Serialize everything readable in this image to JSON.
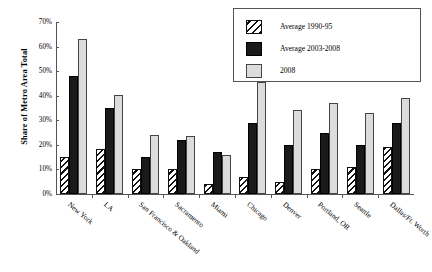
{
  "chart_data": {
    "type": "bar",
    "title": "",
    "xlabel": "",
    "ylabel": "Share of Metro Area Total",
    "ylim": [
      0,
      70
    ],
    "ytick_labels": [
      "70%",
      "60%",
      "50%",
      "40%",
      "30%",
      "20%",
      "10%",
      "0%"
    ],
    "ytick_values": [
      70,
      60,
      50,
      40,
      30,
      20,
      10,
      0
    ],
    "grid": false,
    "legend_position": "top-right",
    "categories": [
      "New York",
      "LA",
      "San Francisco & Oakland",
      "Sacramento",
      "Miami",
      "Chicago",
      "Denver",
      "Portland, OR",
      "Seattle",
      "Dallas/Ft. Worth"
    ],
    "series": [
      {
        "name": "Average 1990-95",
        "style": "hatch",
        "values": [
          15,
          18.5,
          10,
          10,
          4,
          7,
          5,
          10,
          11,
          19
        ]
      },
      {
        "name": "Average 2003-2008",
        "style": "black",
        "values": [
          48,
          35,
          15,
          22,
          17,
          29,
          20,
          25,
          20,
          29
        ]
      },
      {
        "name": "2008",
        "style": "gray",
        "values": [
          63,
          40.5,
          24,
          23.5,
          16,
          45.5,
          34,
          37,
          33,
          39
        ]
      }
    ]
  },
  "legend": {
    "items": [
      {
        "label": "Average 1990-95",
        "style": "hatch"
      },
      {
        "label": "Average 2003-2008",
        "style": "black"
      },
      {
        "label": "2008",
        "style": "gray"
      }
    ]
  }
}
